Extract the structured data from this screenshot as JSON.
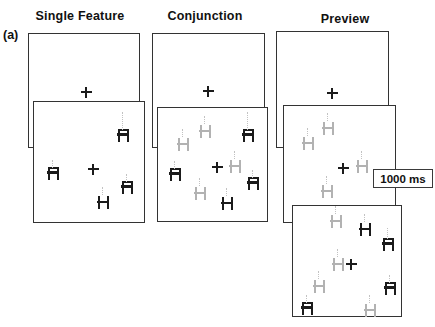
{
  "figure_label": "(a)",
  "panels": [
    {
      "title": "Single Feature"
    },
    {
      "title": "Conjunction"
    },
    {
      "title": "Preview"
    }
  ],
  "duration_badge": {
    "label": "1000 ms"
  },
  "colors": {
    "dark_letter": "#1b1b1b",
    "light_letter": "#b2b2b2",
    "frame_border": "#333333",
    "tick_mark": "#c2c2c2",
    "background": "#ffffff"
  },
  "screens": [
    {
      "name": "single-feature-fixation-screen",
      "x": 28,
      "y": 33,
      "w": 112,
      "h": 115,
      "z": 1,
      "items": [
        {
          "t": "plus",
          "x": 57,
          "y": 58
        }
      ]
    },
    {
      "name": "single-feature-search-screen",
      "x": 33,
      "y": 101,
      "w": 112,
      "h": 122,
      "z": 2,
      "items": [
        {
          "t": "A",
          "c": "dark",
          "x": 89,
          "y": 33,
          "k": 18
        },
        {
          "t": "A",
          "c": "dark",
          "x": 19,
          "y": 71
        },
        {
          "t": "plus",
          "x": 59,
          "y": 67
        },
        {
          "t": "A",
          "c": "dark",
          "x": 93,
          "y": 85
        },
        {
          "t": "H",
          "c": "dark",
          "x": 69,
          "y": 100
        }
      ]
    },
    {
      "name": "conjunction-fixation-screen",
      "x": 152,
      "y": 33,
      "w": 113,
      "h": 115,
      "z": 1,
      "items": [
        {
          "t": "plus",
          "x": 55,
          "y": 57
        }
      ]
    },
    {
      "name": "conjunction-search-screen",
      "x": 157,
      "y": 107,
      "w": 111,
      "h": 115,
      "z": 2,
      "items": [
        {
          "t": "H",
          "c": "light",
          "x": 47,
          "y": 23
        },
        {
          "t": "H",
          "c": "light",
          "x": 25,
          "y": 36
        },
        {
          "t": "A",
          "c": "dark",
          "x": 90,
          "y": 27,
          "k": 18
        },
        {
          "t": "A",
          "c": "dark",
          "x": 17,
          "y": 66
        },
        {
          "t": "plus",
          "x": 59,
          "y": 59
        },
        {
          "t": "H",
          "c": "light",
          "x": 77,
          "y": 58
        },
        {
          "t": "A",
          "c": "dark",
          "x": 95,
          "y": 75
        },
        {
          "t": "H",
          "c": "light",
          "x": 42,
          "y": 85
        },
        {
          "t": "H",
          "c": "dark",
          "x": 69,
          "y": 95
        }
      ]
    },
    {
      "name": "preview-fixation-screen",
      "x": 276,
      "y": 31,
      "w": 113,
      "h": 117,
      "z": 1,
      "items": [
        {
          "t": "plus",
          "x": 55,
          "y": 61
        }
      ]
    },
    {
      "name": "preview-gap-screen",
      "x": 283,
      "y": 105,
      "w": 113,
      "h": 118,
      "z": 2,
      "items": [
        {
          "t": "H",
          "c": "light",
          "x": 44,
          "y": 22
        },
        {
          "t": "H",
          "c": "light",
          "x": 24,
          "y": 37
        },
        {
          "t": "plus",
          "x": 59,
          "y": 62
        },
        {
          "t": "H",
          "c": "light",
          "x": 78,
          "y": 60
        },
        {
          "t": "H",
          "c": "light",
          "x": 43,
          "y": 85
        }
      ]
    },
    {
      "name": "preview-search-screen",
      "x": 292,
      "y": 205,
      "w": 110,
      "h": 112,
      "z": 3,
      "items": [
        {
          "t": "H",
          "c": "light",
          "x": 43,
          "y": 15
        },
        {
          "t": "H",
          "c": "dark",
          "x": 72,
          "y": 23
        },
        {
          "t": "A",
          "c": "dark",
          "x": 95,
          "y": 38,
          "k": 11
        },
        {
          "t": "H",
          "c": "light",
          "x": 45,
          "y": 58
        },
        {
          "t": "plus",
          "x": 58,
          "y": 58
        },
        {
          "t": "H",
          "c": "light",
          "x": 26,
          "y": 80
        },
        {
          "t": "A",
          "c": "dark",
          "x": 97,
          "y": 82
        },
        {
          "t": "A",
          "c": "dark",
          "x": 14,
          "y": 102
        },
        {
          "t": "H",
          "c": "light",
          "x": 77,
          "y": 104
        }
      ]
    }
  ]
}
